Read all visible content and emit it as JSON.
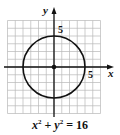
{
  "figure": {
    "type": "circle-graph",
    "equation": {
      "var1": "x",
      "exp1": "2",
      "plus": "+",
      "var2": "y",
      "exp2": "2",
      "equals": "= 16",
      "full": "x² + y² = 16"
    },
    "axes": {
      "x_label": "x",
      "y_label": "y",
      "x_tick_label": "5",
      "y_tick_label": "5"
    },
    "grid": {
      "min": -6,
      "max": 6,
      "step": 1
    },
    "circle": {
      "center": [
        0,
        0
      ],
      "radius": 4
    },
    "center_point": [
      0,
      0
    ],
    "colors": {
      "grid": "#b8b8b8",
      "axis": "#111111",
      "curve": "#111111",
      "background": "#ffffff"
    }
  }
}
